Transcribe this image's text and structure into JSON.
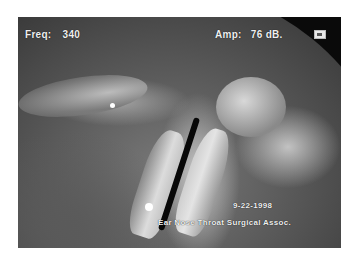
{
  "overlay": {
    "frequency_label": "Freq:",
    "frequency_value": "340",
    "amplitude_label": "Amp:",
    "amplitude_value": "76 dB.",
    "date": "9-22-1998",
    "credit": "Ear Nose Throat Surgical Assoc."
  },
  "image": {
    "subject": "laryngoscopic view of vocal folds",
    "colors": {
      "background": "#ffffff",
      "scope_edge": "#0a0a0a",
      "text": "#f0f0f0"
    }
  },
  "icons": {
    "indicator": "small-box-icon"
  }
}
